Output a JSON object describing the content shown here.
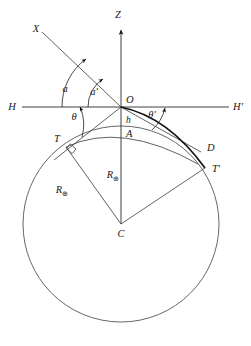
{
  "figure": {
    "type": "geometry-diagram",
    "background_color": "#ffffff",
    "line_color": "#3a3a3a",
    "heavy_line_color": "#111111"
  },
  "labels": {
    "zenith_axis": "Z",
    "ray_x": "X",
    "horizon_left": "H",
    "horizon_right": "H'",
    "origin": "O",
    "height": "h",
    "surface_point": "A",
    "tangent_left": "T",
    "tangent_right": "T'",
    "depression_point": "D",
    "center": "C",
    "angle_a": "a",
    "angle_a_prime": "a'",
    "angle_theta": "θ",
    "angle_theta_prime": "θ'",
    "radius_left": "R",
    "radius_left_sub": "⊕",
    "radius_center": "R",
    "radius_center_sub": "⊕"
  },
  "geometry": {
    "origin": {
      "x": 121,
      "y": 107
    },
    "center": {
      "x": 121,
      "y": 224
    },
    "earth_radius_px": 98,
    "observer_height_px": 12,
    "zenith_arrow_tip": {
      "x": 121,
      "y": 22
    },
    "horizon_left_end": {
      "x": 22,
      "y": 107
    },
    "horizon_right_end": {
      "x": 229,
      "y": 107
    },
    "ray_x_start": {
      "x": 42,
      "y": 32
    },
    "tangent_left_point": {
      "x": 66,
      "y": 147
    },
    "tangent_right_point": {
      "x": 205,
      "y": 168
    },
    "point_d": {
      "x": 200,
      "y": 152
    },
    "point_a": {
      "x": 121,
      "y": 126
    }
  }
}
